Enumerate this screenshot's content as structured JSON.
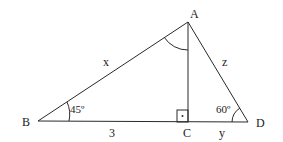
{
  "diagram": {
    "type": "right-triangle-geometry",
    "vertices": {
      "A": {
        "label": "A"
      },
      "B": {
        "label": "B"
      },
      "C": {
        "label": "C"
      },
      "D": {
        "label": "D"
      }
    },
    "sides": {
      "AB": {
        "label": "x"
      },
      "AD": {
        "label": "z"
      },
      "BC": {
        "label": "3"
      },
      "CD": {
        "label": "y"
      }
    },
    "angles": {
      "B": {
        "label": "45º"
      },
      "D": {
        "label": "60º"
      },
      "A": {
        "label": "",
        "marked": true
      },
      "C": {
        "label": "",
        "right_angle": true
      }
    },
    "colors": {
      "stroke": "#2a2a2a",
      "text": "#222222",
      "background": "#ffffff"
    }
  }
}
